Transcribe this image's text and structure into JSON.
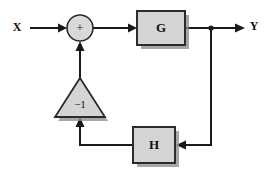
{
  "diagram": {
    "type": "control-system-block-diagram",
    "canvas": {
      "width": 271,
      "height": 174,
      "background": "#ffffff"
    },
    "colors": {
      "line": "#1a1a1a",
      "block_fill": "#d4d4d4",
      "block_stroke": "#2b2b2b",
      "shadow": "#8a8a8a",
      "text": "#111111"
    },
    "signals": {
      "input_label": "X",
      "output_label": "Y"
    },
    "summing_junction": {
      "sign": "+",
      "cx": 80,
      "cy": 28,
      "r": 13
    },
    "blocks": [
      {
        "id": "forward-gain",
        "label": "G",
        "x": 137,
        "y": 11,
        "width": 48,
        "height": 34
      },
      {
        "id": "feedback-gain",
        "label": "H",
        "x": 133,
        "y": 127,
        "width": 42,
        "height": 36
      }
    ],
    "inverter": {
      "id": "inverting-gain",
      "label": "−1",
      "apex_x": 80,
      "apex_y": 78,
      "base_y": 117,
      "base_left_x": 55,
      "base_right_x": 105
    },
    "branch_point": {
      "x": 211,
      "y": 28
    }
  }
}
